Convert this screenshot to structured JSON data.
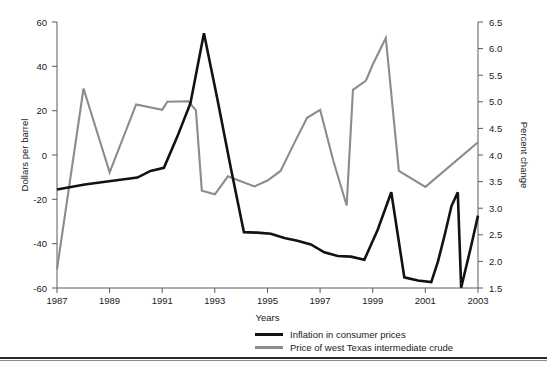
{
  "figure": {
    "top_cropped_text": "",
    "background_color": "#ffffff"
  },
  "axes": {
    "left": {
      "title": "Dollars per barrel",
      "ticks": [
        "60",
        "40",
        "20",
        "0",
        "-20",
        "-40",
        "-60"
      ],
      "min": -60,
      "max": 60
    },
    "right": {
      "title": "Percent change",
      "ticks": [
        "6.5",
        "6.0",
        "5.5",
        "5.0",
        "4.5",
        "4.0",
        "3.5",
        "3.0",
        "2.5",
        "2.0",
        "1.5"
      ],
      "min": 1.5,
      "max": 6.5
    },
    "bottom": {
      "title": "Years",
      "ticks": [
        "1987",
        "1989",
        "1991",
        "1993",
        "1995",
        "1997",
        "1999",
        "2001",
        "2003"
      ],
      "min": 1987,
      "max": 2003
    }
  },
  "legend": {
    "position": "below-axes-right",
    "entries": [
      {
        "label": "Inflation in consumer prices",
        "color": "#121212"
      },
      {
        "label": "Price of west Texas intermediate crude",
        "color": "#8c8c8c"
      }
    ]
  },
  "chart_data": {
    "type": "line",
    "title": "",
    "subtitle": "",
    "xlabel": "Years",
    "ylabel": "Dollars per barrel",
    "y2label": "Percent change",
    "xlim": [
      1987,
      2003
    ],
    "ylim": [
      -60,
      60
    ],
    "y2lim": [
      1.5,
      6.5
    ],
    "grid": false,
    "x": [
      1987,
      1988,
      1989,
      1990,
      1991,
      1992,
      1993,
      1994,
      1995,
      1996,
      1997,
      1998,
      1999,
      2000,
      2001,
      2002,
      2003
    ],
    "series": [
      {
        "name": "Inflation in consumer prices",
        "axis": "right",
        "color": "#121212",
        "units": "percent change",
        "values": [
          4.4,
          4.45,
          4.5,
          4.75,
          6.35,
          3.0,
          2.95,
          2.9,
          2.8,
          2.65,
          2.6,
          3.45,
          1.65,
          1.6,
          3.5,
          1.5,
          2.45
        ]
      },
      {
        "name": "Price of west Texas intermediate crude",
        "axis": "left",
        "color": "#8c8c8c",
        "units": "dollars per barrel",
        "values": [
          -49,
          25,
          -20,
          20,
          23,
          -15,
          -7,
          -13,
          -11,
          19,
          -33,
          -33,
          36,
          56,
          -18,
          -2,
          -2
        ]
      }
    ],
    "series_pixel_paths": {
      "note": "Polyline vertex lists in plot-area fractional coords (0-1 x, 0-1 y from top) reproducing the drawn curves.",
      "inflation_in_consumer_prices": [
        [
          0.0,
          0.63
        ],
        [
          0.066,
          0.611
        ],
        [
          0.128,
          0.598
        ],
        [
          0.191,
          0.585
        ],
        [
          0.222,
          0.56
        ],
        [
          0.254,
          0.548
        ],
        [
          0.286,
          0.43
        ],
        [
          0.317,
          0.305
        ],
        [
          0.349,
          0.042
        ],
        [
          0.381,
          0.29
        ],
        [
          0.413,
          0.55
        ],
        [
          0.444,
          0.79
        ],
        [
          0.476,
          0.792
        ],
        [
          0.508,
          0.796
        ],
        [
          0.54,
          0.812
        ],
        [
          0.571,
          0.822
        ],
        [
          0.603,
          0.836
        ],
        [
          0.635,
          0.866
        ],
        [
          0.667,
          0.88
        ],
        [
          0.698,
          0.882
        ],
        [
          0.73,
          0.894
        ],
        [
          0.762,
          0.78
        ],
        [
          0.794,
          0.64
        ],
        [
          0.825,
          0.96
        ],
        [
          0.857,
          0.972
        ],
        [
          0.889,
          0.978
        ],
        [
          0.905,
          0.9
        ],
        [
          0.921,
          0.8
        ],
        [
          0.937,
          0.692
        ],
        [
          0.952,
          0.64
        ],
        [
          0.96,
          0.999
        ],
        [
          0.984,
          0.84
        ],
        [
          1.0,
          0.728
        ]
      ],
      "price_of_wti_crude": [
        [
          0.0,
          0.93
        ],
        [
          0.063,
          0.25
        ],
        [
          0.125,
          0.565
        ],
        [
          0.188,
          0.31
        ],
        [
          0.25,
          0.33
        ],
        [
          0.262,
          0.3
        ],
        [
          0.312,
          0.298
        ],
        [
          0.33,
          0.332
        ],
        [
          0.344,
          0.634
        ],
        [
          0.375,
          0.648
        ],
        [
          0.406,
          0.58
        ],
        [
          0.438,
          0.6
        ],
        [
          0.469,
          0.618
        ],
        [
          0.5,
          0.596
        ],
        [
          0.531,
          0.56
        ],
        [
          0.562,
          0.46
        ],
        [
          0.594,
          0.36
        ],
        [
          0.625,
          0.33
        ],
        [
          0.656,
          0.52
        ],
        [
          0.688,
          0.69
        ],
        [
          0.703,
          0.255
        ],
        [
          0.734,
          0.22
        ],
        [
          0.75,
          0.16
        ],
        [
          0.781,
          0.06
        ],
        [
          0.812,
          0.56
        ],
        [
          0.875,
          0.62
        ],
        [
          1.0,
          0.452
        ]
      ]
    }
  }
}
